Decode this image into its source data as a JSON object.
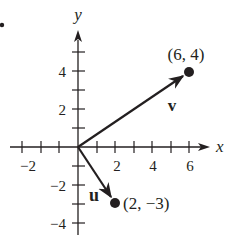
{
  "diagram": {
    "type": "vector-plot",
    "axes": {
      "x_label": "x",
      "y_label": "y",
      "x_ticks": [
        -2,
        2,
        4,
        6
      ],
      "y_ticks": [
        -4,
        -2,
        2,
        4
      ],
      "x_tick_labels": [
        "−2",
        "2",
        "4",
        "6"
      ],
      "y_tick_labels": [
        "−4",
        "−2",
        "2",
        "4"
      ]
    },
    "vectors": [
      {
        "name": "v",
        "from": [
          0,
          0
        ],
        "to": [
          6,
          4
        ],
        "endpoint_label": "(6, 4)"
      },
      {
        "name": "u",
        "from": [
          0,
          0
        ],
        "to": [
          2,
          -3
        ],
        "endpoint_label": "(2, −3)"
      }
    ],
    "colors": {
      "ink": "#231f20",
      "background": "#ffffff"
    }
  }
}
